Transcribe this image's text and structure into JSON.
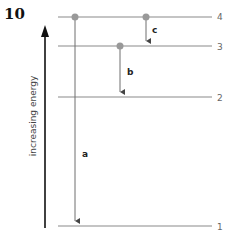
{
  "question_number": "10",
  "axis": {
    "label": "increasing energy",
    "direction": "up"
  },
  "levels": [
    {
      "label": "4",
      "y": 17
    },
    {
      "label": "3",
      "y": 46
    },
    {
      "label": "2",
      "y": 97
    },
    {
      "label": "1",
      "y": 226
    }
  ],
  "transitions": [
    {
      "label": "a",
      "from": "4",
      "to": "1",
      "x": 75
    },
    {
      "label": "b",
      "from": "3",
      "to": "2",
      "x": 120
    },
    {
      "label": "c",
      "from": "4",
      "to": "3",
      "x": 146
    }
  ],
  "colors": {
    "level_line": "#8a8a8a",
    "transition": "#6e6e6e",
    "dot": "#999999",
    "axis": "#111111"
  }
}
